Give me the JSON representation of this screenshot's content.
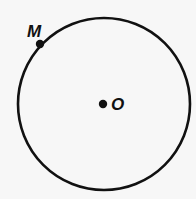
{
  "diagram": {
    "type": "circle-with-points",
    "circle": {
      "cx": 104,
      "cy": 104,
      "r": 86,
      "stroke": "#111111",
      "stroke_width": 2.6
    },
    "points": [
      {
        "id": "M",
        "label": "M",
        "x": 40,
        "y": 44,
        "label_x": 27,
        "label_y": 37
      },
      {
        "id": "O",
        "label": "O",
        "x": 103,
        "y": 104,
        "label_x": 111,
        "label_y": 110
      }
    ],
    "colors": {
      "ink": "#111111",
      "background": "#f7f7f7"
    }
  }
}
